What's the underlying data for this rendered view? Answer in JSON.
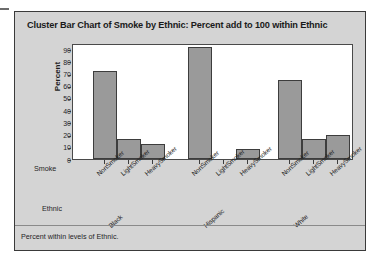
{
  "chart_data": {
    "type": "bar",
    "title": "Cluster Bar Chart of Smoke by Ethnic: Percent add to 100 within Ethnic",
    "xlabel": "Ethnic",
    "ylabel": "Percent",
    "inner_group_label": "Smoke",
    "footnote": "Percent within levels of Ethnic.",
    "ylim": [
      0,
      95
    ],
    "yticks": [
      0,
      10,
      20,
      30,
      40,
      50,
      60,
      70,
      80,
      90
    ],
    "ytick_labels": [
      "0",
      "10",
      "20",
      "30",
      "40",
      "50",
      "60",
      "70",
      "80",
      "90"
    ],
    "grid": false,
    "legend": "none",
    "bar_color": "#9a9a9a",
    "bar_edge_color": "#3d3d3d",
    "plot_background": "#ffffff",
    "panel_background": "#d4d4d4",
    "categories": [
      "NonSmoker",
      "LightSmoker",
      "HeavySmoker"
    ],
    "groups": [
      "Black",
      "Hispanic",
      "White"
    ],
    "series": [
      {
        "name": "Black",
        "categories": [
          "NonSmoker",
          "LightSmoker",
          "HeavySmoker"
        ],
        "values": [
          72,
          16,
          12.5
        ]
      },
      {
        "name": "Hispanic",
        "categories": [
          "NonSmoker",
          "LightSmoker",
          "HeavySmoker"
        ],
        "values": [
          92,
          0,
          8.5
        ]
      },
      {
        "name": "White",
        "categories": [
          "NonSmoker",
          "LightSmoker",
          "HeavySmoker"
        ],
        "values": [
          64.5,
          16.5,
          20
        ]
      }
    ],
    "bars": [
      {
        "group": "Black",
        "category": "NonSmoker",
        "value": 72
      },
      {
        "group": "Black",
        "category": "LightSmoker",
        "value": 16
      },
      {
        "group": "Black",
        "category": "HeavySmoker",
        "value": 12.5
      },
      {
        "group": "Hispanic",
        "category": "NonSmoker",
        "value": 92
      },
      {
        "group": "Hispanic",
        "category": "LightSmoker",
        "value": 0
      },
      {
        "group": "Hispanic",
        "category": "HeavySmoker",
        "value": 8.5
      },
      {
        "group": "White",
        "category": "NonSmoker",
        "value": 64.5
      },
      {
        "group": "White",
        "category": "LightSmoker",
        "value": 16.5
      },
      {
        "group": "White",
        "category": "HeavySmoker",
        "value": 20
      }
    ]
  }
}
